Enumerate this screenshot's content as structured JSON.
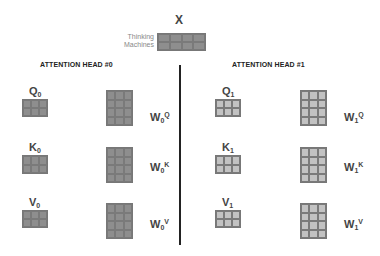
{
  "input": {
    "label": "X",
    "side_text_line1": "Thinking",
    "side_text_line2": "Machines",
    "grid": {
      "rows": 2,
      "cols": 4
    }
  },
  "heads": [
    {
      "title": "ATTENTION HEAD #0",
      "shade": "dark",
      "matrices": [
        {
          "name": "Q",
          "sub": "0",
          "grid": {
            "rows": 2,
            "cols": 3
          }
        },
        {
          "name": "K",
          "sub": "0",
          "grid": {
            "rows": 2,
            "cols": 3
          }
        },
        {
          "name": "V",
          "sub": "0",
          "grid": {
            "rows": 2,
            "cols": 3
          }
        }
      ],
      "weights": [
        {
          "name": "W",
          "sub": "0",
          "sup": "Q",
          "grid": {
            "rows": 4,
            "cols": 3
          }
        },
        {
          "name": "W",
          "sub": "0",
          "sup": "K",
          "grid": {
            "rows": 4,
            "cols": 3
          }
        },
        {
          "name": "W",
          "sub": "0",
          "sup": "V",
          "grid": {
            "rows": 4,
            "cols": 3
          }
        }
      ]
    },
    {
      "title": "ATTENTION HEAD #1",
      "shade": "light",
      "matrices": [
        {
          "name": "Q",
          "sub": "1",
          "grid": {
            "rows": 2,
            "cols": 3
          }
        },
        {
          "name": "K",
          "sub": "1",
          "grid": {
            "rows": 2,
            "cols": 3
          }
        },
        {
          "name": "V",
          "sub": "1",
          "grid": {
            "rows": 2,
            "cols": 3
          }
        }
      ],
      "weights": [
        {
          "name": "W",
          "sub": "1",
          "sup": "Q",
          "grid": {
            "rows": 4,
            "cols": 3
          }
        },
        {
          "name": "W",
          "sub": "1",
          "sup": "K",
          "grid": {
            "rows": 4,
            "cols": 3
          }
        },
        {
          "name": "W",
          "sub": "1",
          "sup": "V",
          "grid": {
            "rows": 4,
            "cols": 3
          }
        }
      ]
    }
  ],
  "colors": {
    "dark_cell": "#8e8e8e",
    "light_cell": "#c2c2c2",
    "divider": "#222222"
  }
}
